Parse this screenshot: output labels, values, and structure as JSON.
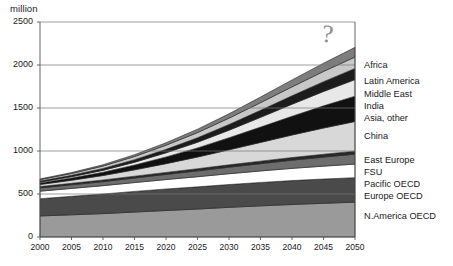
{
  "chart_data": {
    "type": "area",
    "title": "",
    "subtitle": "",
    "unit_label": "million",
    "xlabel": "",
    "ylabel": "million",
    "x": [
      2000,
      2005,
      2010,
      2015,
      2020,
      2025,
      2030,
      2035,
      2040,
      2045,
      2050
    ],
    "xtick_labels": [
      "2000",
      "2005",
      "2010",
      "2015",
      "2020",
      "2025",
      "2030",
      "2035",
      "2040",
      "2045",
      "2050"
    ],
    "ytick_labels": [
      "0",
      "500",
      "1000",
      "1500",
      "2000",
      "2500"
    ],
    "ytick_values": [
      0,
      500,
      1000,
      1500,
      2000,
      2500
    ],
    "ylim": [
      0,
      2500
    ],
    "xlim": [
      2000,
      2050
    ],
    "grid": "horizontal",
    "legend_position": "right-stacked",
    "stacking": "bottom-to-top",
    "annotation": "?",
    "series": [
      {
        "name": "N.America OECD",
        "color": "#9a9a9a",
        "values": [
          245,
          258,
          272,
          290,
          308,
          325,
          345,
          362,
          378,
          392,
          405
        ]
      },
      {
        "name": "Europe OECD",
        "color": "#4a4a4a",
        "values": [
          200,
          215,
          228,
          240,
          250,
          258,
          265,
          272,
          278,
          282,
          285
        ]
      },
      {
        "name": "Pacific OECD",
        "color": "#ffffff",
        "values": [
          88,
          92,
          97,
          103,
          110,
          118,
          126,
          134,
          142,
          150,
          158
        ]
      },
      {
        "name": "FSU",
        "color": "#6d6d6d",
        "values": [
          38,
          42,
          47,
          53,
          60,
          68,
          76,
          85,
          95,
          105,
          115
        ]
      },
      {
        "name": "East Europe",
        "color": "#2a2a2a",
        "values": [
          15,
          17,
          19,
          21,
          23,
          25,
          27,
          29,
          31,
          33,
          35
        ]
      },
      {
        "name": "China",
        "color": "#d8d8d8",
        "values": [
          25,
          36,
          52,
          74,
          102,
          136,
          175,
          218,
          262,
          305,
          345
        ]
      },
      {
        "name": "Asia, other",
        "color": "#111111",
        "values": [
          18,
          26,
          38,
          55,
          78,
          106,
          140,
          178,
          218,
          258,
          295
        ]
      },
      {
        "name": "India",
        "color": "#e8e8e8",
        "values": [
          10,
          15,
          22,
          33,
          48,
          66,
          88,
          113,
          140,
          167,
          192
        ]
      },
      {
        "name": "Middle East",
        "color": "#1c1c1c",
        "values": [
          12,
          16,
          22,
          30,
          40,
          52,
          66,
          82,
          98,
          114,
          130
        ]
      },
      {
        "name": "Latin America",
        "color": "#c8c8c8",
        "values": [
          16,
          21,
          28,
          37,
          48,
          60,
          74,
          89,
          104,
          119,
          133
        ]
      },
      {
        "name": "Africa",
        "color": "#7d7d7d",
        "values": [
          8,
          11,
          15,
          21,
          29,
          39,
          51,
          65,
          80,
          95,
          112
        ]
      }
    ]
  },
  "axes": {
    "unit": "million",
    "y_ticks": [
      "2500",
      "2000",
      "1500",
      "1000",
      "500",
      "0"
    ],
    "x_ticks": [
      "2000",
      "2005",
      "2010",
      "2015",
      "2020",
      "2025",
      "2030",
      "2035",
      "2040",
      "2045",
      "2050"
    ]
  },
  "legend": {
    "items": [
      {
        "label": "Africa"
      },
      {
        "label": "Latin America"
      },
      {
        "label": "Middle East"
      },
      {
        "label": "India"
      },
      {
        "label": "Asia, other"
      },
      {
        "label": "China"
      },
      {
        "label": "East Europe"
      },
      {
        "label": "FSU"
      },
      {
        "label": "Pacific OECD"
      },
      {
        "label": "Europe OECD"
      },
      {
        "label": "N.America OECD"
      }
    ]
  },
  "annotation": {
    "mark": "?"
  }
}
